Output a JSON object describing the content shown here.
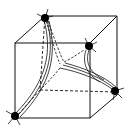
{
  "diagram": {
    "colors": {
      "line": "#111111",
      "atom": "#000000",
      "background": "#ffffff"
    },
    "cube": {
      "front_face": [
        [
          15,
          43
        ],
        [
          90,
          43
        ],
        [
          90,
          118
        ],
        [
          15,
          118
        ]
      ],
      "back_face": [
        [
          45,
          16
        ],
        [
          117,
          16
        ],
        [
          117,
          95
        ],
        [
          40,
          90
        ]
      ]
    },
    "atoms": [
      {
        "id": "top-back-left",
        "x": 45,
        "y": 18
      },
      {
        "id": "front-top-right",
        "x": 89,
        "y": 46
      },
      {
        "id": "back-bottom-right",
        "x": 115,
        "y": 91
      },
      {
        "id": "front-bottom-left",
        "x": 15,
        "y": 116
      }
    ],
    "junction": {
      "x": 62,
      "y": 66
    }
  }
}
